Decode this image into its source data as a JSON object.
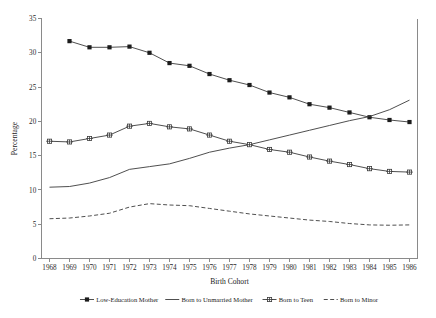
{
  "chart_data": {
    "type": "line",
    "title": "",
    "xlabel": "Birth Cohort",
    "ylabel": "Percentage",
    "xlim": [
      1967.6,
      1986.4
    ],
    "ylim": [
      0,
      35
    ],
    "yticks": [
      0,
      5,
      10,
      15,
      20,
      25,
      30,
      35
    ],
    "grid": false,
    "legend_position": "bottom",
    "categories": [
      1968,
      1969,
      1970,
      1971,
      1972,
      1973,
      1974,
      1975,
      1976,
      1977,
      1978,
      1979,
      1980,
      1981,
      1982,
      1983,
      1984,
      1985,
      1986
    ],
    "xticklabels": [
      "1968",
      "1969",
      "1970",
      "1971",
      "1972",
      "1973",
      "1974",
      "1975",
      "1976",
      "1977",
      "1978",
      "1979",
      "1980",
      "1981",
      "1982",
      "1983",
      "1984",
      "1985",
      "1986"
    ],
    "series": [
      {
        "name": "Low-Education Mother",
        "marker": "filled-square",
        "linestyle": "solid",
        "color": "#3b3b3b",
        "x": [
          1969,
          1970,
          1971,
          1972,
          1973,
          1974,
          1975,
          1976,
          1977,
          1978,
          1979,
          1980,
          1981,
          1982,
          1983,
          1984,
          1985,
          1986
        ],
        "values": [
          31.7,
          30.8,
          30.8,
          30.9,
          30.0,
          28.5,
          28.1,
          26.9,
          26.0,
          25.3,
          24.2,
          23.5,
          22.5,
          22.0,
          21.3,
          20.6,
          20.2,
          19.9
        ]
      },
      {
        "name": "Born to Unmarried Mother",
        "marker": "none",
        "linestyle": "solid",
        "color": "#3b3b3b",
        "x": [
          1968,
          1969,
          1970,
          1971,
          1972,
          1973,
          1974,
          1975,
          1976,
          1977,
          1978,
          1979,
          1980,
          1981,
          1982,
          1983,
          1984,
          1985,
          1986
        ],
        "values": [
          10.4,
          10.5,
          11.0,
          11.8,
          13.0,
          13.4,
          13.8,
          14.6,
          15.5,
          16.1,
          16.6,
          17.3,
          18.0,
          18.7,
          19.4,
          20.1,
          20.7,
          21.7,
          23.1
        ]
      },
      {
        "name": "Born to Teen",
        "marker": "open-square",
        "linestyle": "solid",
        "color": "#3b3b3b",
        "x": [
          1968,
          1969,
          1970,
          1971,
          1972,
          1973,
          1974,
          1975,
          1976,
          1977,
          1978,
          1979,
          1980,
          1981,
          1982,
          1983,
          1984,
          1985,
          1986
        ],
        "values": [
          17.1,
          17.0,
          17.5,
          18.0,
          19.3,
          19.7,
          19.2,
          18.9,
          18.0,
          17.1,
          16.6,
          15.9,
          15.5,
          14.8,
          14.2,
          13.7,
          13.1,
          12.7,
          12.6
        ]
      },
      {
        "name": "Born to Minor",
        "marker": "none",
        "linestyle": "dashed",
        "color": "#3b3b3b",
        "x": [
          1968,
          1969,
          1970,
          1971,
          1972,
          1973,
          1974,
          1975,
          1976,
          1977,
          1978,
          1979,
          1980,
          1981,
          1982,
          1983,
          1984,
          1985,
          1986
        ],
        "values": [
          5.8,
          5.9,
          6.2,
          6.6,
          7.5,
          8.0,
          7.8,
          7.7,
          7.3,
          6.9,
          6.5,
          6.2,
          5.9,
          5.6,
          5.4,
          5.1,
          4.9,
          4.85,
          4.9
        ]
      }
    ]
  },
  "legend": {
    "items": [
      {
        "label": "Low-Education Mother",
        "marker": "filled-square",
        "linestyle": "solid"
      },
      {
        "label": "Born to Unmarried Mother",
        "marker": "none",
        "linestyle": "solid"
      },
      {
        "label": "Born to Teen",
        "marker": "open-square",
        "linestyle": "solid"
      },
      {
        "label": "Born to Minor",
        "marker": "none",
        "linestyle": "dashed"
      }
    ]
  }
}
